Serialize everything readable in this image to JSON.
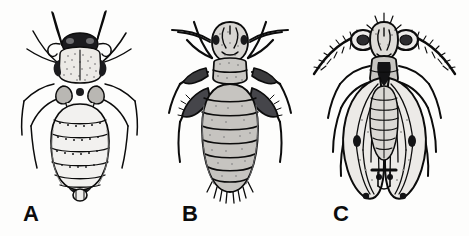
{
  "plate": {
    "title": "Comparative dorsal-view illustrations of three psocid (booklice/barklice) forms",
    "background_color": "#fdfdfc",
    "ink_color": "#0c0c0c",
    "width": 469,
    "height": 236,
    "style": "black-and-white stippled scientific line drawing"
  },
  "figures": [
    {
      "id": "a",
      "label": "A",
      "name": "apterous-psocid-nymph",
      "description": "Wingless soft-bodied psocid in dorsal view with dark head, pale stippled thorax, long slender antennae, six slender legs and a banded segmented abdomen bearing rows of small dark setae",
      "label_x": 23,
      "label_y": 203,
      "body_fill": "#f2f1ef",
      "shade_fill": "#9a9a98",
      "dark_fill": "#17171a",
      "abdomen_segments": 7,
      "antenna_count": 2,
      "leg_count": 6
    },
    {
      "id": "b",
      "label": "B",
      "name": "brachypterous-psocid",
      "description": "Stout dorsal-view psocid with heavily stippled grey body, broad dark bristly femora, long outswept antennae and a plump segmented abdomen fringed with hairs at the apex",
      "label_x": 182,
      "label_y": 203,
      "body_fill": "#cfcecb",
      "shade_fill": "#6e6e6c",
      "dark_fill": "#161618",
      "abdomen_segments": 8,
      "antenna_count": 2,
      "leg_count": 6
    },
    {
      "id": "c",
      "label": "C",
      "name": "winged-adult-psocid",
      "description": "Fully winged adult psocid in dorsal view with large compound eyes, thick bristly antennae spread wide, and two pairs of elongate folded wings marked with dark veins and pterostigma spots",
      "label_x": 333,
      "label_y": 203,
      "body_fill": "#e8e7e4",
      "wing_fill": "#eeedeb",
      "shade_fill": "#8d8d8b",
      "dark_fill": "#141416",
      "wing_count": 4,
      "antenna_count": 2,
      "leg_count": 6
    }
  ]
}
